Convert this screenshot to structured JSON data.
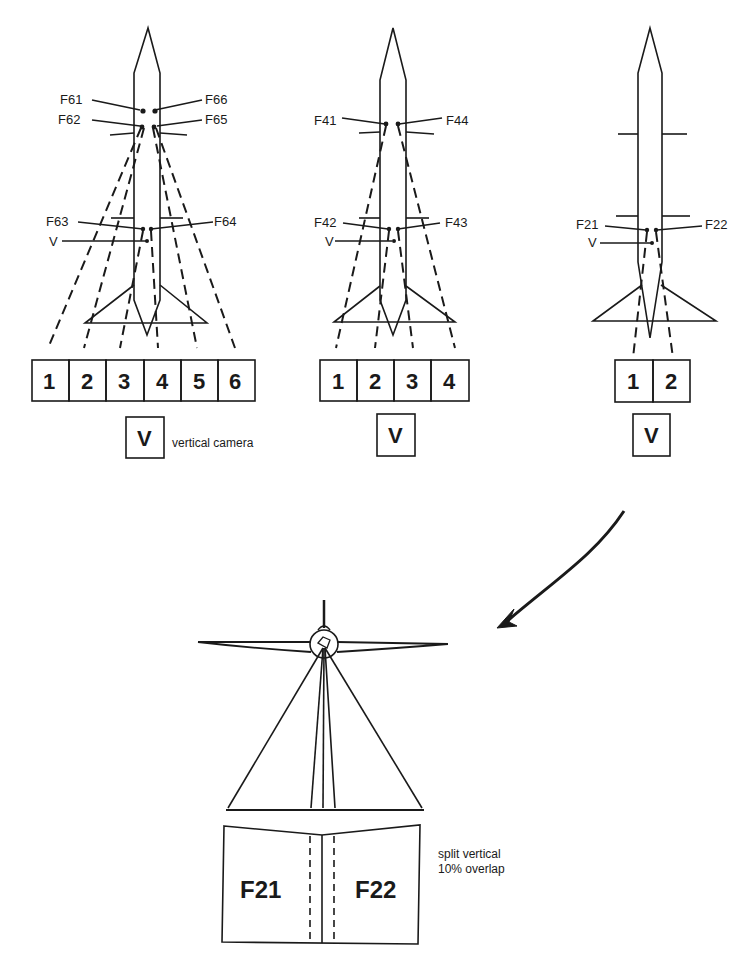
{
  "config_6cam": {
    "camera_labels": [
      "F61",
      "F62",
      "F63",
      "F64",
      "F65",
      "F66"
    ],
    "vertical_label": "V",
    "boxes": [
      "1",
      "2",
      "3",
      "4",
      "5",
      "6"
    ],
    "vertical_box": "V",
    "vertical_caption": "vertical camera"
  },
  "config_4cam": {
    "camera_labels": [
      "F41",
      "F42",
      "F43",
      "F44"
    ],
    "vertical_label": "V",
    "boxes": [
      "1",
      "2",
      "3",
      "4"
    ],
    "vertical_box": "V"
  },
  "config_2cam": {
    "camera_labels": [
      "F21",
      "F22"
    ],
    "vertical_label": "V",
    "boxes": [
      "1",
      "2"
    ],
    "vertical_box": "V"
  },
  "split_view": {
    "frame_left": "F21",
    "frame_right": "F22",
    "caption_line1": "split vertical",
    "caption_line2": "10% overlap"
  },
  "colors": {
    "ink": "#1a1a1a",
    "paper": "#ffffff"
  }
}
